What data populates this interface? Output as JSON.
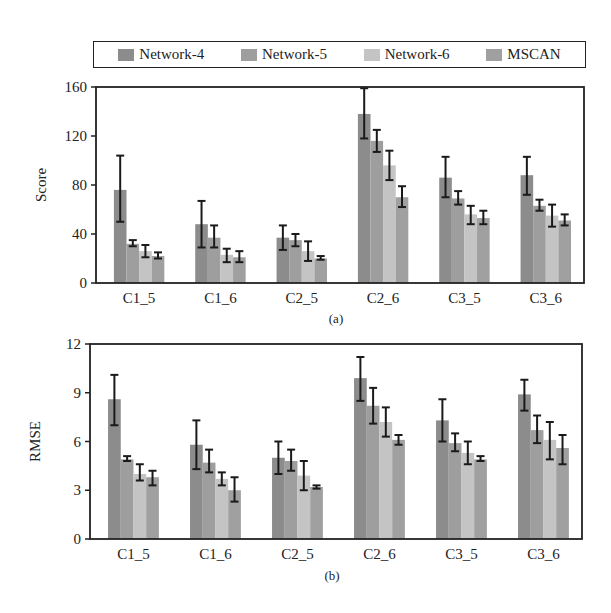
{
  "legend": {
    "items": [
      {
        "label": "Network-4",
        "color": "#8c8c8c"
      },
      {
        "label": "Network-5",
        "color": "#9e9e9e"
      },
      {
        "label": "Network-6",
        "color": "#c4c4c4"
      },
      {
        "label": "MSCAN",
        "color": "#a0a0a0"
      }
    ]
  },
  "chart_data": [
    {
      "type": "bar",
      "title": "",
      "caption": "(a)",
      "xlabel": "",
      "ylabel": "Score",
      "ylim": [
        0,
        160
      ],
      "yticks": [
        0,
        40,
        80,
        120,
        160
      ],
      "categories": [
        "C1_5",
        "C1_6",
        "C2_5",
        "C2_6",
        "C3_5",
        "C3_6"
      ],
      "series": [
        {
          "name": "Network-4",
          "values": [
            76,
            48,
            37,
            138,
            86,
            88
          ],
          "err_low": [
            50,
            29,
            27,
            118,
            70,
            72
          ],
          "err_high": [
            104,
            67,
            47,
            159,
            103,
            103
          ]
        },
        {
          "name": "Network-5",
          "values": [
            32,
            37,
            35,
            116,
            69,
            63
          ],
          "err_low": [
            30,
            29,
            30,
            107,
            64,
            59
          ],
          "err_high": [
            35,
            47,
            40,
            125,
            75,
            68
          ]
        },
        {
          "name": "Network-6",
          "values": [
            26,
            23,
            26,
            96,
            56,
            55
          ],
          "err_low": [
            21,
            17,
            18,
            84,
            48,
            46
          ],
          "err_high": [
            31,
            28,
            34,
            108,
            63,
            64
          ]
        },
        {
          "name": "MSCAN",
          "values": [
            22,
            21,
            20,
            70,
            53,
            51
          ],
          "err_low": [
            20,
            17,
            19,
            62,
            48,
            47
          ],
          "err_high": [
            25,
            26,
            22,
            79,
            59,
            56
          ]
        }
      ],
      "grid": false,
      "legend_position": "top"
    },
    {
      "type": "bar",
      "title": "",
      "caption": "(b)",
      "xlabel": "",
      "ylabel": "RMSE",
      "ylim": [
        0,
        12
      ],
      "yticks": [
        0,
        3,
        6,
        9,
        12
      ],
      "categories": [
        "C1_5",
        "C1_6",
        "C2_5",
        "C2_6",
        "C3_5",
        "C3_6"
      ],
      "series": [
        {
          "name": "Network-4",
          "values": [
            8.6,
            5.8,
            5.0,
            9.9,
            7.3,
            8.9
          ],
          "err_low": [
            7.0,
            4.3,
            4.0,
            8.5,
            6.0,
            7.9
          ],
          "err_high": [
            10.1,
            7.3,
            6.0,
            11.2,
            8.6,
            9.8
          ]
        },
        {
          "name": "Network-5",
          "values": [
            4.9,
            4.7,
            4.8,
            8.2,
            5.9,
            6.7
          ],
          "err_low": [
            4.8,
            4.1,
            4.2,
            7.1,
            5.4,
            5.9
          ],
          "err_high": [
            5.1,
            5.5,
            5.5,
            9.3,
            6.5,
            7.6
          ]
        },
        {
          "name": "Network-6",
          "values": [
            4.0,
            3.7,
            3.9,
            7.2,
            5.3,
            6.1
          ],
          "err_low": [
            3.6,
            3.3,
            3.0,
            6.3,
            4.6,
            4.9
          ],
          "err_high": [
            4.6,
            4.1,
            4.8,
            8.1,
            6.0,
            7.2
          ]
        },
        {
          "name": "MSCAN",
          "values": [
            3.8,
            3.0,
            3.2,
            6.1,
            4.9,
            5.6
          ],
          "err_low": [
            3.3,
            2.3,
            3.1,
            5.8,
            4.8,
            4.6
          ],
          "err_high": [
            4.2,
            3.8,
            3.3,
            6.4,
            5.1,
            6.4
          ]
        }
      ],
      "grid": false,
      "legend_position": "top"
    }
  ]
}
